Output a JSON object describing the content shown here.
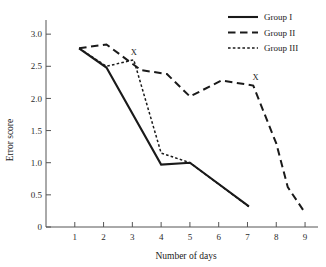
{
  "chart_data": {
    "type": "line",
    "title": "",
    "xlabel": "Number of days",
    "ylabel": "Error score",
    "xlim": [
      0,
      9.45
    ],
    "ylim": [
      0,
      3.22
    ],
    "grid": false,
    "legend_position": "top-right",
    "x_ticks": [
      "1",
      "2",
      "3",
      "4",
      "5",
      "6",
      "7",
      "8",
      "9"
    ],
    "x_tick_values": [
      1,
      2,
      3,
      4,
      5,
      6,
      7,
      8,
      9
    ],
    "y_ticks": [
      "0",
      "0.5",
      "1.0",
      "1.5",
      "2.0",
      "2.5",
      "3.0"
    ],
    "y_tick_values": [
      0,
      0.5,
      1.0,
      1.5,
      2.0,
      2.5,
      3.0
    ],
    "series": [
      {
        "name": "Group I",
        "style": "solid",
        "color": "#1a1a1a",
        "points": [
          [
            1.15,
            2.78
          ],
          [
            2.1,
            2.48
          ],
          [
            4.0,
            0.97
          ],
          [
            5.0,
            1.0
          ],
          [
            7.05,
            0.32
          ]
        ]
      },
      {
        "name": "Group II",
        "style": "dashed",
        "color": "#1a1a1a",
        "points": [
          [
            1.15,
            2.78
          ],
          [
            2.1,
            2.84
          ],
          [
            3.3,
            2.44
          ],
          [
            4.2,
            2.38
          ],
          [
            5.0,
            2.03
          ],
          [
            6.1,
            2.28
          ],
          [
            7.2,
            2.2
          ],
          [
            8.0,
            1.3
          ],
          [
            8.4,
            0.62
          ],
          [
            9.0,
            0.22
          ]
        ]
      },
      {
        "name": "Group III",
        "style": "dotted",
        "color": "#1a1a1a",
        "points": [
          [
            1.15,
            2.78
          ],
          [
            2.1,
            2.5
          ],
          [
            3.05,
            2.6
          ],
          [
            4.0,
            1.15
          ],
          [
            5.0,
            1.0
          ],
          [
            7.1,
            0.3
          ]
        ]
      }
    ],
    "annotations": [
      {
        "text": "X",
        "x": 3.05,
        "y": 2.68
      },
      {
        "text": "X",
        "x": 7.28,
        "y": 2.28
      }
    ]
  },
  "legend": {
    "items": [
      {
        "label": "Group I"
      },
      {
        "label": "Group II"
      },
      {
        "label": "Group III"
      }
    ]
  },
  "axes": {
    "y_title": "Error score",
    "x_title": "Number of days"
  }
}
